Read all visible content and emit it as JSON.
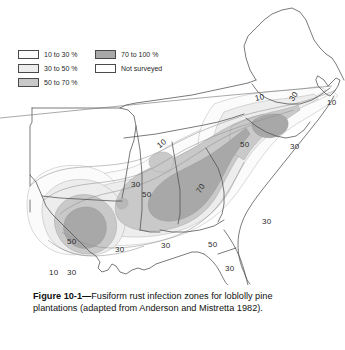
{
  "figure": {
    "caption_label": "Figure 10-1",
    "caption_dash": "—",
    "caption_line1_rest": "Fusiform rust infection",
    "caption_line2": "zones for loblolly pine plantations",
    "caption_line3": "(adapted from Anderson and Mistretta 1982)."
  },
  "legend": {
    "items": [
      {
        "label": "10 to 30 %",
        "color": "#fbfbfb"
      },
      {
        "label": "30 to 50 %",
        "color": "#ededed"
      },
      {
        "label": "50 to 70 %",
        "color": "#c9c9c9"
      },
      {
        "label": "70 to 100 %",
        "color": "#a8a8a8"
      },
      {
        "label": "Not surveyed",
        "color": "#ffffff"
      }
    ]
  },
  "map": {
    "title_implicit": "Southeastern United States fusiform rust infection zones",
    "contour_labels": [
      {
        "value": "10",
        "x": 255,
        "y": 93,
        "rotate": -12
      },
      {
        "value": "30",
        "x": 289,
        "y": 92,
        "rotate": -58
      },
      {
        "value": "10",
        "x": 327,
        "y": 98,
        "rotate": 0
      },
      {
        "value": "50",
        "x": 240,
        "y": 140,
        "rotate": 0
      },
      {
        "value": "30",
        "x": 290,
        "y": 142,
        "rotate": 0
      },
      {
        "value": "10",
        "x": 157,
        "y": 139,
        "rotate": -38
      },
      {
        "value": "30",
        "x": 131,
        "y": 180,
        "rotate": 0
      },
      {
        "value": "50",
        "x": 142,
        "y": 190,
        "rotate": 0
      },
      {
        "value": "70",
        "x": 196,
        "y": 184,
        "rotate": -58
      },
      {
        "value": "30",
        "x": 262,
        "y": 217,
        "rotate": 0
      },
      {
        "value": "50",
        "x": 67,
        "y": 237,
        "rotate": 0
      },
      {
        "value": "30",
        "x": 115,
        "y": 245,
        "rotate": 0
      },
      {
        "value": "30",
        "x": 161,
        "y": 241,
        "rotate": 0
      },
      {
        "value": "50",
        "x": 208,
        "y": 240,
        "rotate": 0
      },
      {
        "value": "10",
        "x": 49,
        "y": 268,
        "rotate": 0
      },
      {
        "value": "30",
        "x": 67,
        "y": 268,
        "rotate": 0
      },
      {
        "value": "30",
        "x": 225,
        "y": 264,
        "rotate": 0
      }
    ],
    "colors": {
      "zone_10_30": "#fbfbfb",
      "zone_30_50": "#ededed",
      "zone_50_70": "#c9c9c9",
      "zone_70_100": "#a8a8a8",
      "not_surveyed": "#ffffff",
      "outline": "#4d4d4d",
      "state_border": "#595959",
      "contour_line": "#8a8a8a"
    }
  }
}
